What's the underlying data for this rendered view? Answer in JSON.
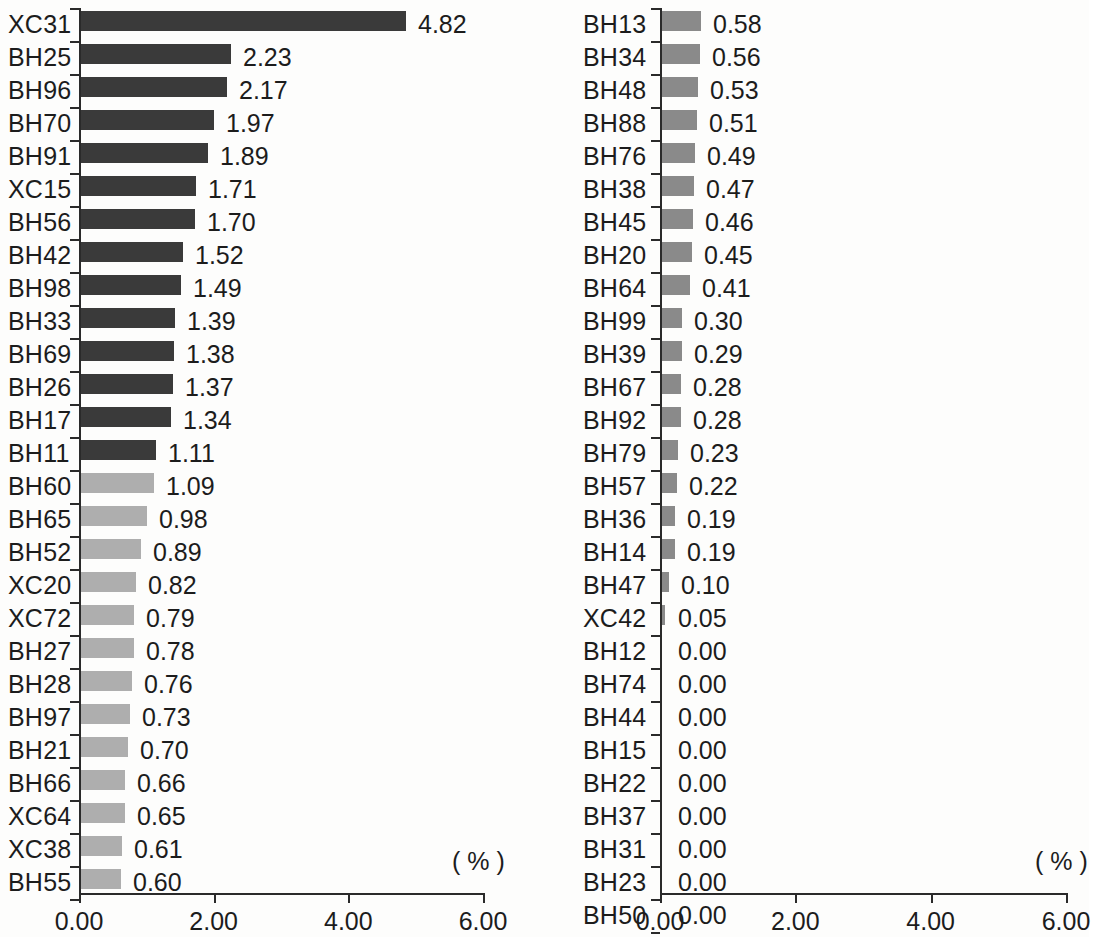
{
  "chart_data": [
    {
      "type": "bar",
      "orientation": "horizontal",
      "panel": "left",
      "title": "",
      "xlabel": "( % )",
      "ylabel": "",
      "xlim": [
        0,
        6
      ],
      "xticks": [
        "0.00",
        "2.00",
        "4.00",
        "6.00"
      ],
      "xtick_values": [
        0,
        2,
        4,
        6
      ],
      "grid": false,
      "legend": "none",
      "unit_annotation": "( % )",
      "categories": [
        "XC31",
        "BH25",
        "BH96",
        "BH70",
        "BH91",
        "XC15",
        "BH56",
        "BH42",
        "BH98",
        "BH33",
        "BH69",
        "BH26",
        "BH17",
        "BH11",
        "BH60",
        "BH65",
        "BH52",
        "XC20",
        "XC72",
        "BH27",
        "BH28",
        "BH97",
        "BH21",
        "BH66",
        "XC64",
        "XC38",
        "BH55"
      ],
      "values": [
        4.82,
        2.23,
        2.17,
        1.97,
        1.89,
        1.71,
        1.7,
        1.52,
        1.49,
        1.39,
        1.38,
        1.37,
        1.34,
        1.11,
        1.09,
        0.98,
        0.89,
        0.82,
        0.79,
        0.78,
        0.76,
        0.73,
        0.7,
        0.66,
        0.65,
        0.61,
        0.6
      ],
      "value_labels": [
        "4.82",
        "2.23",
        "2.17",
        "1.97",
        "1.89",
        "1.71",
        "1.70",
        "1.52",
        "1.49",
        "1.39",
        "1.38",
        "1.37",
        "1.34",
        "1.11",
        "1.09",
        "0.98",
        "0.89",
        "0.82",
        "0.79",
        "0.78",
        "0.76",
        "0.73",
        "0.70",
        "0.66",
        "0.65",
        "0.61",
        "0.60"
      ],
      "bar_shades": [
        "dark",
        "dark",
        "dark",
        "dark",
        "dark",
        "dark",
        "dark",
        "dark",
        "dark",
        "dark",
        "dark",
        "dark",
        "dark",
        "dark",
        "light",
        "light",
        "light",
        "light",
        "light",
        "light",
        "light",
        "light",
        "light",
        "light",
        "light",
        "light",
        "light"
      ]
    },
    {
      "type": "bar",
      "orientation": "horizontal",
      "panel": "right",
      "title": "",
      "xlabel": "( % )",
      "ylabel": "",
      "xlim": [
        0,
        6
      ],
      "xticks": [
        "0.00",
        "2.00",
        "4.00",
        "6.00"
      ],
      "xtick_values": [
        0,
        2,
        4,
        6
      ],
      "grid": false,
      "legend": "none",
      "unit_annotation": "( % )",
      "categories": [
        "BH13",
        "BH34",
        "BH48",
        "BH88",
        "BH76",
        "BH38",
        "BH45",
        "BH20",
        "BH64",
        "BH99",
        "BH39",
        "BH67",
        "BH92",
        "BH79",
        "BH57",
        "BH36",
        "BH14",
        "BH47",
        "XC42",
        "BH12",
        "BH74",
        "BH44",
        "BH15",
        "BH22",
        "BH37",
        "BH31",
        "BH23",
        "BH50"
      ],
      "values": [
        0.58,
        0.56,
        0.53,
        0.51,
        0.49,
        0.47,
        0.46,
        0.45,
        0.41,
        0.3,
        0.29,
        0.28,
        0.28,
        0.23,
        0.22,
        0.19,
        0.19,
        0.1,
        0.05,
        0.0,
        0.0,
        0.0,
        0.0,
        0.0,
        0.0,
        0.0,
        0.0,
        0.0
      ],
      "value_labels": [
        "0.58",
        "0.56",
        "0.53",
        "0.51",
        "0.49",
        "0.47",
        "0.46",
        "0.45",
        "0.41",
        "0.30",
        "0.29",
        "0.28",
        "0.28",
        "0.23",
        "0.22",
        "0.19",
        "0.19",
        "0.10",
        "0.05",
        "0.00",
        "0.00",
        "0.00",
        "0.00",
        "0.00",
        "0.00",
        "0.00",
        "0.00",
        "0.00"
      ],
      "bar_shades": [
        "mid",
        "mid",
        "mid",
        "mid",
        "mid",
        "mid",
        "mid",
        "mid",
        "mid",
        "mid",
        "mid",
        "mid",
        "mid",
        "mid",
        "mid",
        "mid",
        "mid",
        "mid",
        "mid",
        "mid",
        "mid",
        "mid",
        "mid",
        "mid",
        "mid",
        "mid",
        "mid",
        "mid"
      ]
    }
  ],
  "colors": {
    "bar_dark": "#3a3a3a",
    "bar_mid": "#8a8a8a",
    "bar_light": "#aeaeae",
    "axis": "#2a2a2a",
    "text": "#1c1c1c",
    "background": "#fdfdfc"
  }
}
